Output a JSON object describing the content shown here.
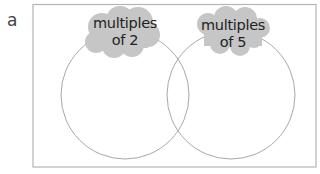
{
  "question_label": "a",
  "venn": {
    "sets": [
      {
        "label_line1": "multiples",
        "label_line2": "of 2"
      },
      {
        "label_line1": "multiples",
        "label_line2": "of 5"
      }
    ],
    "colors": {
      "outline": "#a8a8a8",
      "cloud": "#c6c6c6",
      "frame": "#b5b5b5"
    }
  }
}
